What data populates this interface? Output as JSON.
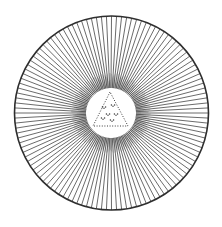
{
  "illustration": {
    "title": "Radiant disc with central triangle",
    "description": "Engraved circle filled with radiating lines around a central white disc containing a dotted triangle with dots",
    "colors": {
      "background": "#ffffff",
      "ink": "#3a3a3a",
      "rim": "#2e2e2e",
      "halo": "#6a6a6a"
    },
    "outer_circle": {
      "cx": 111.5,
      "cy": 113,
      "r": 97,
      "stroke_width": 1.6
    },
    "rays": {
      "count": 120,
      "inner_r": 25,
      "stroke_width": 0.75
    },
    "inner_disc": {
      "cx": 111,
      "cy": 113,
      "r": 24
    },
    "triangle": {
      "points": [
        [
          110,
          92
        ],
        [
          93,
          126
        ],
        [
          128,
          126
        ]
      ],
      "style": "dotted"
    },
    "inner_dots": [
      [
        104,
        107
      ],
      [
        113,
        105
      ],
      [
        108,
        114
      ],
      [
        116,
        114
      ],
      [
        103,
        118
      ],
      [
        112,
        120
      ]
    ]
  }
}
